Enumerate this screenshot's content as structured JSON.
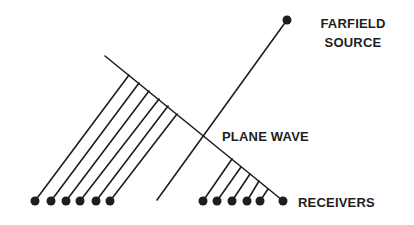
{
  "labels": {
    "source_line1": "FARFIELD",
    "source_line2": "SOURCE",
    "plane_wave": "PLANE WAVE",
    "receivers": "RECEIVERS"
  },
  "colors": {
    "ink": "#1e1e1e",
    "background": "#ffffff"
  },
  "geometry": {
    "wavefront": {
      "x1": 105,
      "y1": 56,
      "x2": 282,
      "y2": 200
    },
    "source": {
      "x": 287,
      "y": 20,
      "r": 4.5
    },
    "source_ray": {
      "x1": 157,
      "y1": 200,
      "x2": 287,
      "y2": 20
    },
    "left_receivers": [
      {
        "x": 35,
        "y": 201,
        "wx": 129,
        "wy": 75
      },
      {
        "x": 51,
        "y": 201,
        "wx": 139,
        "wy": 83
      },
      {
        "x": 66,
        "y": 201,
        "wx": 149,
        "wy": 91
      },
      {
        "x": 80,
        "y": 201,
        "wx": 159,
        "wy": 99
      },
      {
        "x": 96,
        "y": 201,
        "wx": 168,
        "wy": 106
      },
      {
        "x": 110,
        "y": 201,
        "wx": 177,
        "wy": 114
      }
    ],
    "right_receivers": [
      {
        "x": 203,
        "y": 201,
        "wx": 232,
        "wy": 159
      },
      {
        "x": 217,
        "y": 201,
        "wx": 241,
        "wy": 167
      },
      {
        "x": 232,
        "y": 201,
        "wx": 250,
        "wy": 174
      },
      {
        "x": 247,
        "y": 201,
        "wx": 259,
        "wy": 181
      },
      {
        "x": 260,
        "y": 201,
        "wx": 268,
        "wy": 189
      },
      {
        "x": 283,
        "y": 201
      }
    ],
    "receiver_radius": 4.5
  }
}
